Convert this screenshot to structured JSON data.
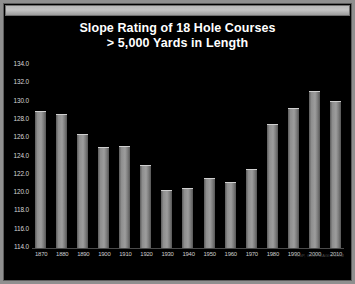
{
  "window": {
    "titlebar_label": ""
  },
  "chart_data": {
    "type": "bar",
    "title": "Slope Rating of 18 Hole Courses",
    "subtitle": "> 5,000 Yards in Length",
    "xlabel": "",
    "ylabel": "",
    "ylim": [
      114.0,
      134.0
    ],
    "ytick_step": 2.0,
    "yticks": [
      "134.0",
      "132.0",
      "130.0",
      "128.0",
      "126.0",
      "124.0",
      "122.0",
      "120.0",
      "118.0",
      "116.0",
      "114.0"
    ],
    "grid": false,
    "legend": "none",
    "categories": [
      "1870",
      "1880",
      "1890",
      "1900",
      "1910",
      "1920",
      "1930",
      "1940",
      "1950",
      "1960",
      "1970",
      "1980",
      "1990",
      "2000",
      "2010"
    ],
    "values": [
      129.0,
      128.6,
      126.5,
      125.0,
      125.2,
      123.1,
      120.3,
      120.6,
      121.7,
      121.2,
      122.6,
      127.6,
      129.3,
      131.2,
      130.1
    ],
    "bar_color": "#9d9d9d",
    "background_color": "#000000",
    "text_color": "#ffffff",
    "watermark": "RGP, GOLFMAGIC.COM"
  }
}
